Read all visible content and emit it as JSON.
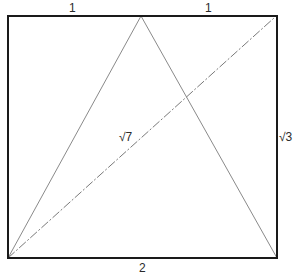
{
  "diagram": {
    "colors": {
      "frame": "#1a1a1a",
      "triangle": "#8a8a8a",
      "diagonal": "#7a7a7a",
      "text": "#2a2a2a",
      "background": "#ffffff"
    },
    "labels": {
      "top_left_segment": "1",
      "top_right_segment": "1",
      "diagonal": "√7",
      "right_side": "√3",
      "bottom_side": "2"
    },
    "geometry": {
      "rectangle": {
        "x1": 8,
        "y1": 16,
        "x2": 277,
        "y2": 258
      },
      "triangle_apex": {
        "x": 141,
        "y": 16
      },
      "triangle_base_left": {
        "x": 8,
        "y": 258
      },
      "triangle_base_right": {
        "x": 277,
        "y": 258
      },
      "diagonal_start": {
        "x": 8,
        "y": 258
      },
      "diagonal_end": {
        "x": 273,
        "y": 18
      }
    }
  }
}
